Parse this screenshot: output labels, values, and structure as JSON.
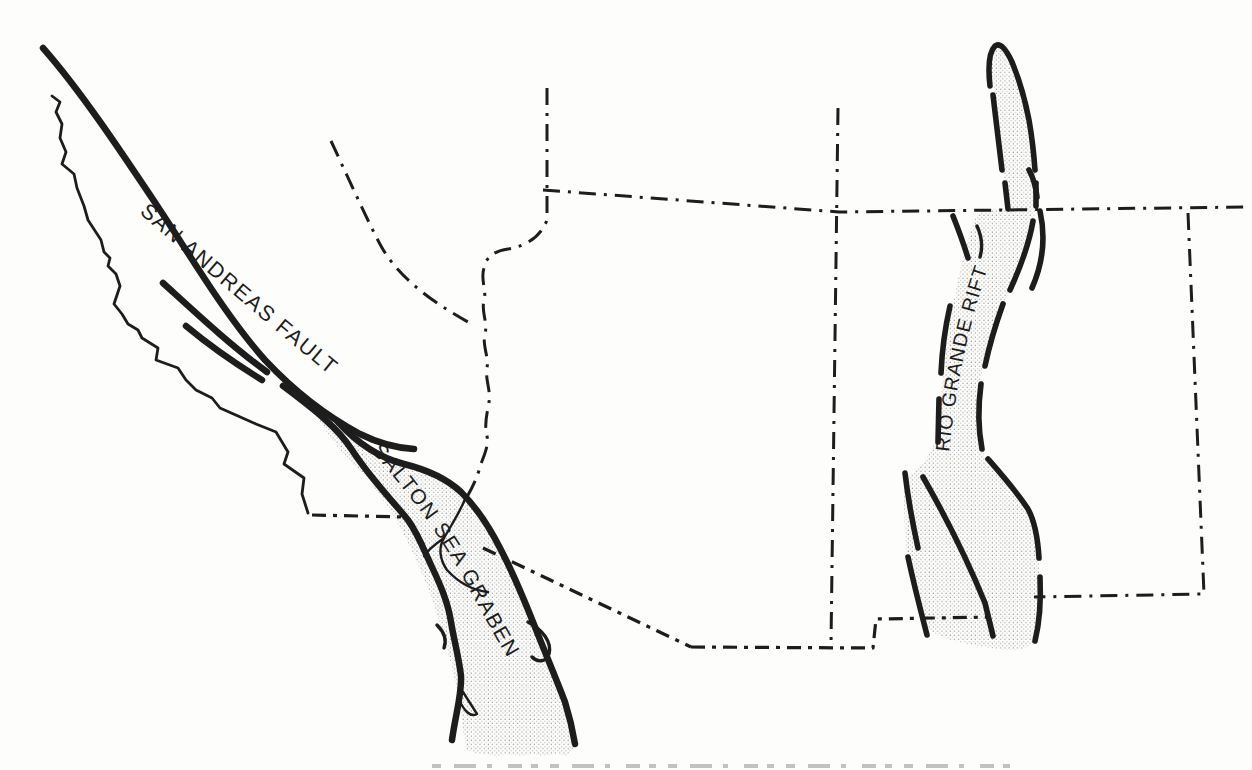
{
  "map": {
    "description": "Hand-drawn sketch map of the southwestern United States showing major rift and fault zones",
    "labels": {
      "san_andreas_fault": "SAN ANDREAS FAULT",
      "salton_sea_graben": "SALTON SEA GRABEN",
      "rio_grande_rift": "RIO GRANDE RIFT"
    },
    "regions": [
      {
        "name": "San Andreas Fault",
        "style": "thick solid fault traces along California coast"
      },
      {
        "name": "Salton Sea Graben",
        "style": "stippled band bounded by thick fault lines"
      },
      {
        "name": "Rio Grande Rift",
        "style": "stippled band bounded by dashed thick fault segments"
      }
    ],
    "line_styles": {
      "state_borders": "dash-dot",
      "fault_traces": "thick solid",
      "coastline": "thin solid"
    },
    "colors": {
      "ink": "#1d1d1d",
      "paper": "#fdfdfc",
      "stipple_dot": "#777777"
    }
  }
}
